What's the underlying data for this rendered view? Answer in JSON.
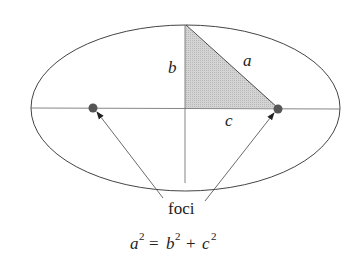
{
  "diagram": {
    "type": "ellipse-foci",
    "labels": {
      "semi_major": "a",
      "semi_minor": "b",
      "focal_distance": "c",
      "foci": "foci"
    },
    "equation": {
      "lhs_base": "a",
      "lhs_exp": "2",
      "eq": "=",
      "t1_base": "b",
      "t1_exp": "2",
      "plus": "+",
      "t2_base": "c",
      "t2_exp": "2"
    },
    "colors": {
      "line": "#555555",
      "triangle_fill": "#c8c8c8",
      "focus_dot": "#555555"
    }
  }
}
